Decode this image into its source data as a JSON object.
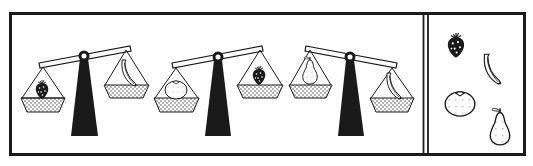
{
  "puzzle": {
    "type": "balance-scale-weight-ordering",
    "colors": {
      "ink": "#1a1a1a",
      "background": "#ffffff",
      "dots": "#555555"
    },
    "scales": [
      {
        "id": 1,
        "heavier_side": "left",
        "left": "strawberry",
        "right": "banana"
      },
      {
        "id": 2,
        "heavier_side": "left",
        "left": "orange",
        "right": "strawberry"
      },
      {
        "id": 3,
        "heavier_side": "right",
        "left": "pear",
        "right": "banana"
      }
    ],
    "options_panel": {
      "items": [
        "strawberry",
        "banana",
        "orange",
        "pear"
      ]
    }
  }
}
